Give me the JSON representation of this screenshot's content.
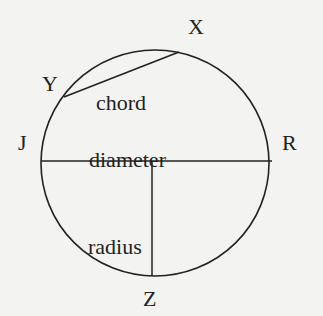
{
  "diagram": {
    "type": "circle-parts",
    "colors": {
      "background": "#f3f3f1",
      "stroke": "#222222",
      "text": "#222222"
    },
    "points": [
      {
        "id": "X",
        "label": "X",
        "x": 178,
        "y": 52
      },
      {
        "id": "Y",
        "label": "Y",
        "x": 64,
        "y": 97
      },
      {
        "id": "J",
        "label": "J",
        "x": 41,
        "y": 161
      },
      {
        "id": "R",
        "label": "R",
        "x": 271,
        "y": 161
      },
      {
        "id": "Z",
        "label": "Z",
        "x": 152,
        "y": 276
      }
    ],
    "segments": [
      {
        "name": "chord",
        "label": "chord",
        "from": "Y",
        "to": "X"
      },
      {
        "name": "diameter",
        "label": "diameter",
        "from": "J",
        "to": "R"
      },
      {
        "name": "radius",
        "label": "radius",
        "from": "center",
        "to": "Z"
      }
    ],
    "labels": {
      "X": "X",
      "Y": "Y",
      "J": "J",
      "R": "R",
      "Z": "Z",
      "chord": "chord",
      "diameter": "diameter",
      "radius": "radius"
    }
  }
}
